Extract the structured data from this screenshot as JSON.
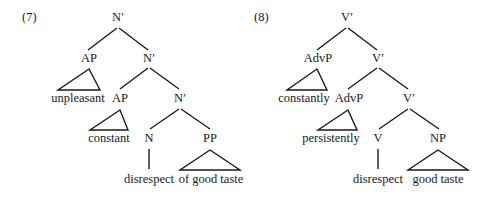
{
  "diagrams": [
    {
      "number": "(7)",
      "nodes": {
        "root": "N′",
        "ap1": "AP",
        "ap1_word": "unpleasant",
        "nbar1": "N′",
        "ap2": "AP",
        "ap2_word": "constant",
        "nbar2": "N′",
        "head": "N",
        "head_word": "disrespect",
        "comp": "PP",
        "comp_word": "of good taste"
      }
    },
    {
      "number": "(8)",
      "nodes": {
        "root": "V′",
        "ap1": "AdvP",
        "ap1_word": "constantly",
        "nbar1": "V′",
        "ap2": "AdvP",
        "ap2_word": "persistently",
        "nbar2": "V′",
        "head": "V",
        "head_word": "disrespect",
        "comp": "NP",
        "comp_word": "good taste"
      }
    }
  ]
}
